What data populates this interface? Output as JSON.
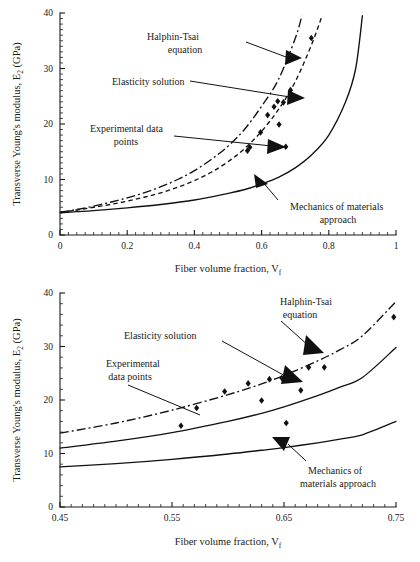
{
  "figure": {
    "panels": [
      {
        "id": "top",
        "y_axis_title_pre": "Transverse Young's modulus, E",
        "y_axis_title_sub": "2",
        "y_axis_title_post": " (GPa)",
        "x_axis_title_pre": "Fiber volume fraction, V",
        "x_axis_title_sub": "f",
        "annotations": [
          {
            "name": "halphin-tsai",
            "line1": "Halphin-Tsai",
            "line2": "equation"
          },
          {
            "name": "elasticity",
            "line1": "Elasticity solution",
            "line2": ""
          },
          {
            "name": "experimental",
            "line1": "Experimental data",
            "line2": "points"
          },
          {
            "name": "mechanics",
            "line1": "Mechanics of materials",
            "line2": "approach"
          }
        ]
      },
      {
        "id": "bottom",
        "y_axis_title_pre": "Transverse Young's modulus, E",
        "y_axis_title_sub": "2",
        "y_axis_title_post": " (GPa)",
        "x_axis_title_pre": "Fiber volume fraction, V",
        "x_axis_title_sub": "f",
        "annotations": [
          {
            "name": "halphin-tsai",
            "line1": "Halphin-Tsai",
            "line2": "equation"
          },
          {
            "name": "elasticity",
            "line1": "Elasticity solution",
            "line2": ""
          },
          {
            "name": "experimental",
            "line1": "Experimental",
            "line2": "data points"
          },
          {
            "name": "mechanics",
            "line1": "Mechanics of",
            "line2": "materials approach"
          }
        ]
      }
    ]
  },
  "chart_data": [
    {
      "id": "top-panel",
      "type": "line",
      "title": "",
      "xlabel": "Fiber volume fraction, Vf",
      "ylabel": "Transverse Young's modulus, E2 (GPa)",
      "xlim": [
        0,
        1
      ],
      "ylim": [
        0,
        40
      ],
      "xticks": [
        0,
        0.2,
        0.4,
        0.6,
        0.8,
        1
      ],
      "xtick_labels": [
        "0",
        "0.2",
        "0.4",
        "0.6",
        "0.8",
        "1"
      ],
      "yticks": [
        0,
        10,
        20,
        30,
        40
      ],
      "ytick_labels": [
        "0",
        "10",
        "20",
        "30",
        "40"
      ],
      "x_minor_step": 0.025,
      "y_minor_step": 1,
      "grid": false,
      "legend_position": "inline-annotations",
      "series": [
        {
          "name": "Halphin-Tsai equation",
          "style": "dash-dot",
          "x": [
            0.0,
            0.05,
            0.1,
            0.15,
            0.2,
            0.25,
            0.3,
            0.35,
            0.4,
            0.45,
            0.5,
            0.55,
            0.6,
            0.65,
            0.7,
            0.72
          ],
          "y": [
            4.1,
            4.6,
            5.2,
            5.9,
            6.7,
            7.6,
            8.7,
            10.0,
            11.6,
            13.6,
            16.0,
            19.1,
            23.2,
            28.0,
            35.4,
            39.5
          ]
        },
        {
          "name": "Elasticity solution",
          "style": "dashed",
          "x": [
            0.0,
            0.05,
            0.1,
            0.15,
            0.2,
            0.25,
            0.3,
            0.35,
            0.4,
            0.45,
            0.5,
            0.55,
            0.6,
            0.65,
            0.7,
            0.75,
            0.78
          ],
          "y": [
            4.1,
            4.5,
            5.0,
            5.5,
            6.1,
            6.8,
            7.6,
            8.6,
            9.8,
            11.3,
            13.2,
            15.6,
            18.7,
            22.6,
            27.6,
            34.5,
            39.5
          ]
        },
        {
          "name": "Mechanics of materials approach",
          "style": "solid",
          "x": [
            0.0,
            0.05,
            0.1,
            0.2,
            0.3,
            0.4,
            0.5,
            0.55,
            0.6,
            0.65,
            0.7,
            0.75,
            0.8,
            0.85,
            0.88,
            0.9
          ],
          "y": [
            4.0,
            4.2,
            4.4,
            4.9,
            5.5,
            6.3,
            7.5,
            8.2,
            9.2,
            10.4,
            12.1,
            14.5,
            18.0,
            24.0,
            30.0,
            39.5
          ]
        },
        {
          "name": "Experimental data points",
          "style": "scatter",
          "x": [
            0.558,
            0.565,
            0.597,
            0.618,
            0.63,
            0.637,
            0.648,
            0.652,
            0.665,
            0.672,
            0.686,
            0.748
          ],
          "y": [
            15.2,
            15.8,
            18.5,
            21.6,
            15.7,
            23.1,
            24.1,
            19.9,
            23.9,
            15.9,
            26.1,
            35.5
          ]
        }
      ]
    },
    {
      "id": "bottom-panel",
      "type": "line",
      "title": "",
      "xlabel": "Fiber volume fraction, Vf",
      "ylabel": "Transverse Young's modulus, E2 (GPa)",
      "xlim": [
        0.45,
        0.75
      ],
      "ylim": [
        0,
        40
      ],
      "xticks": [
        0.45,
        0.55,
        0.65,
        0.75
      ],
      "xtick_labels": [
        "0.45",
        "0.55",
        "0.65",
        "0.75"
      ],
      "yticks": [
        0,
        10,
        20,
        30,
        40
      ],
      "ytick_labels": [
        "0",
        "10",
        "20",
        "30",
        "40"
      ],
      "x_minor_step": 0.01,
      "y_minor_step": 2,
      "grid": false,
      "legend_position": "inline-annotations",
      "series": [
        {
          "name": "Halphin-Tsai equation",
          "style": "dash-dot",
          "x": [
            0.45,
            0.5,
            0.55,
            0.6,
            0.63,
            0.65,
            0.68,
            0.7,
            0.72,
            0.75
          ],
          "y": [
            13.8,
            15.7,
            18.1,
            21.0,
            23.0,
            24.6,
            27.3,
            29.4,
            32.0,
            38.4
          ]
        },
        {
          "name": "Elasticity solution",
          "style": "solid",
          "x": [
            0.45,
            0.5,
            0.55,
            0.6,
            0.63,
            0.65,
            0.68,
            0.7,
            0.72,
            0.75
          ],
          "y": [
            11.0,
            12.3,
            13.9,
            16.0,
            17.5,
            18.7,
            20.8,
            22.4,
            24.2,
            29.8
          ]
        },
        {
          "name": "Mechanics of materials approach",
          "style": "solid",
          "x": [
            0.45,
            0.5,
            0.55,
            0.6,
            0.63,
            0.65,
            0.68,
            0.7,
            0.72,
            0.75
          ],
          "y": [
            7.5,
            8.1,
            8.9,
            9.9,
            10.6,
            11.1,
            12.0,
            12.7,
            13.5,
            16.0
          ]
        },
        {
          "name": "Experimental data points",
          "style": "scatter",
          "x": [
            0.558,
            0.572,
            0.597,
            0.618,
            0.63,
            0.637,
            0.648,
            0.652,
            0.665,
            0.672,
            0.686,
            0.748
          ],
          "y": [
            15.2,
            18.5,
            21.6,
            23.1,
            19.9,
            23.9,
            24.1,
            15.7,
            21.8,
            26.1,
            26.1,
            35.5
          ]
        }
      ]
    }
  ]
}
